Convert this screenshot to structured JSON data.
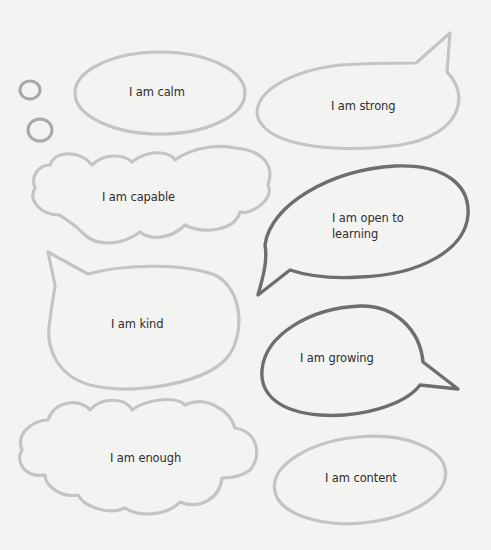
{
  "page": {
    "background": "#f3f3f2",
    "stroke_colors": {
      "light": "#c4c4c2",
      "dark": "#6e6e6c"
    }
  },
  "bubbles": [
    {
      "id": "calm",
      "shape": "thought-oval",
      "label": "I am calm"
    },
    {
      "id": "strong",
      "shape": "speech-tail-top-right",
      "label": "I am strong"
    },
    {
      "id": "capable",
      "shape": "cloud",
      "label": "I am capable"
    },
    {
      "id": "open",
      "shape": "speech-tail-bottom-left",
      "label": "I am open to learning"
    },
    {
      "id": "kind",
      "shape": "speech-tail-top-left",
      "label": "I am kind"
    },
    {
      "id": "growing",
      "shape": "speech-tail-right",
      "label": "I am growing"
    },
    {
      "id": "enough",
      "shape": "cloud",
      "label": "I am enough"
    },
    {
      "id": "content",
      "shape": "oval",
      "label": "I am content"
    }
  ]
}
